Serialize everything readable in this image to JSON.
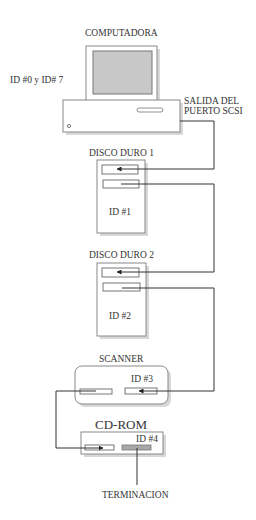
{
  "computer": {
    "title": "COMPUTADORA",
    "ids": "ID #0 y ID# 7",
    "port_label_line1": "SALIDA DEL",
    "port_label_line2": "PUERTO SCSI"
  },
  "devices": [
    {
      "name": "DISCO DURO 1",
      "id": "ID #1"
    },
    {
      "name": "DISCO DURO 2",
      "id": "ID #2"
    },
    {
      "name": "SCANNER",
      "id": "ID #3"
    },
    {
      "name": "CD-ROM",
      "id": "ID #4"
    }
  ],
  "terminator": {
    "label": "TERMINACION"
  },
  "colors": {
    "line": "#333333",
    "screen": "#c8c8c8",
    "terminator": "#a8a8a8",
    "shadow": "#d8d8d8"
  }
}
